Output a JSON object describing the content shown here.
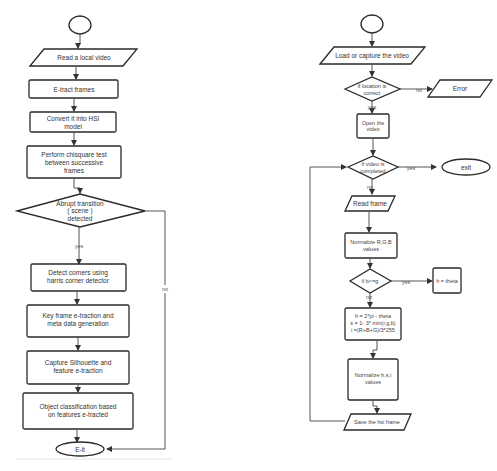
{
  "left_flowchart": {
    "start": "",
    "nodes": [
      {
        "id": "read_video",
        "type": "parallelogram",
        "lines": [
          "Read a local video"
        ]
      },
      {
        "id": "extract_frames",
        "type": "process",
        "lines": [
          "E-tract frames"
        ]
      },
      {
        "id": "convert_hsi",
        "type": "process",
        "lines": [
          "Convert it into HSI",
          "model"
        ]
      },
      {
        "id": "chisquare",
        "type": "process",
        "lines": [
          "Perform chisquare test",
          "between successive",
          "frames"
        ]
      },
      {
        "id": "abrupt",
        "type": "decision",
        "lines": [
          "Abrupt transition",
          "( scene )",
          "detected"
        ]
      },
      {
        "id": "detect_corners",
        "type": "process",
        "lines": [
          "Detect corners using",
          "harris corner detector"
        ]
      },
      {
        "id": "key_frame",
        "type": "process",
        "lines": [
          "Key frame e-traction and",
          "meta data generation"
        ]
      },
      {
        "id": "silhouette",
        "type": "process",
        "lines": [
          "Capture Silhouette and",
          "feature e-traction"
        ]
      },
      {
        "id": "classification",
        "type": "process",
        "lines": [
          "Object classification based",
          "on features e-tracted"
        ]
      },
      {
        "id": "exit",
        "type": "terminal",
        "lines": [
          "E-it"
        ]
      }
    ],
    "edge_labels": {
      "yes": "yes",
      "no": "no"
    }
  },
  "right_flowchart": {
    "start": "",
    "nodes": [
      {
        "id": "load",
        "type": "parallelogram",
        "lines": [
          "Load or capture the video"
        ]
      },
      {
        "id": "location",
        "type": "decision",
        "lines": [
          "if location is",
          "correct"
        ]
      },
      {
        "id": "error",
        "type": "parallelogram",
        "lines": [
          "Error"
        ]
      },
      {
        "id": "open",
        "type": "process",
        "lines": [
          "Open the",
          "video"
        ]
      },
      {
        "id": "completed",
        "type": "decision",
        "lines": [
          "if video is",
          "completed"
        ]
      },
      {
        "id": "exit",
        "type": "terminal",
        "lines": [
          "exit"
        ]
      },
      {
        "id": "read_frame",
        "type": "parallelogram",
        "lines": [
          "Read frame"
        ]
      },
      {
        "id": "normalize_rgb",
        "type": "process",
        "lines": [
          "Normalize R,G,B",
          "values"
        ]
      },
      {
        "id": "bcg",
        "type": "decision",
        "lines": [
          "if b<=g"
        ]
      },
      {
        "id": "h_theta",
        "type": "process",
        "lines": [
          "h = theta"
        ]
      },
      {
        "id": "formula",
        "type": "process",
        "lines": [
          "h = 2*pi - theta",
          "s = 1- 3* min(r,g,b)",
          "i =(R+B+G)/3*255"
        ]
      },
      {
        "id": "normalize_hsi",
        "type": "process",
        "lines": [
          "Normalize h,s,i",
          "values"
        ]
      },
      {
        "id": "save",
        "type": "parallelogram",
        "lines": [
          "Save the hsi frame"
        ]
      }
    ],
    "edge_labels": {
      "no_location": "no",
      "yes_location": "yes",
      "yes_completed": "yes",
      "no_completed": "no",
      "yes_bcg": "yes",
      "no_bcg": "no"
    }
  }
}
